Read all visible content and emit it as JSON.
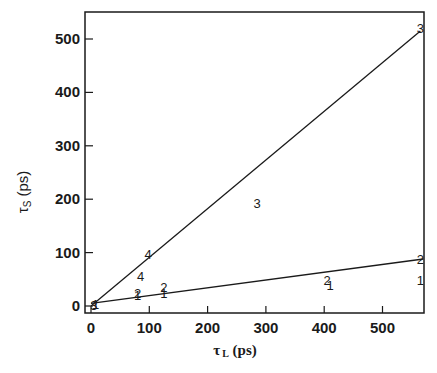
{
  "chart_data": {
    "type": "scatter",
    "title": "",
    "xlabel": "τL (ps)",
    "ylabel": "τS (ps)",
    "xlabel_parts": {
      "main": "τ",
      "sub": "L",
      "unit": " (ps)"
    },
    "ylabel_parts": {
      "main": "τ",
      "sub": "S",
      "unit": " (ps)"
    },
    "xlim": [
      -10,
      570
    ],
    "ylim": [
      -12,
      550
    ],
    "xticks": [
      0,
      100,
      200,
      300,
      400,
      500
    ],
    "yticks": [
      0,
      100,
      200,
      300,
      400,
      500
    ],
    "grid": false,
    "legend": null,
    "lines": [
      {
        "name": "upper fit line",
        "x": [
          0,
          565
        ],
        "y": [
          0,
          515
        ]
      },
      {
        "name": "lower fit line",
        "x": [
          0,
          570
        ],
        "y": [
          5,
          88
        ]
      }
    ],
    "series": [
      {
        "name": "1",
        "points": [
          [
            8,
            4
          ],
          [
            80,
            20
          ],
          [
            125,
            25
          ],
          [
            410,
            40
          ],
          [
            565,
            48
          ]
        ]
      },
      {
        "name": "2",
        "points": [
          [
            80,
            25
          ],
          [
            125,
            35
          ],
          [
            405,
            48
          ],
          [
            565,
            88
          ]
        ]
      },
      {
        "name": "3",
        "points": [
          [
            5,
            1
          ],
          [
            285,
            192
          ],
          [
            565,
            520
          ]
        ]
      },
      {
        "name": "4",
        "points": [
          [
            85,
            56
          ],
          [
            98,
            98
          ]
        ]
      }
    ],
    "annotations": []
  },
  "axes": {
    "x_tick_labels": [
      "0",
      "100",
      "200",
      "300",
      "400",
      "500"
    ],
    "y_tick_labels": [
      "0",
      "100",
      "200",
      "300",
      "400",
      "500"
    ]
  }
}
